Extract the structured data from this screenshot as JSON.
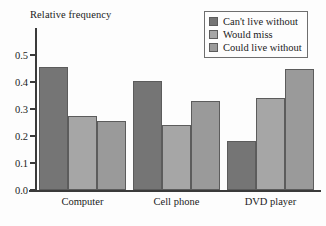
{
  "chart_data": {
    "type": "bar",
    "title": "",
    "xlabel": "",
    "ylabel": "Relative frequency",
    "ylim": [
      0.0,
      0.55
    ],
    "ytick_values": [
      0.0,
      0.1,
      0.2,
      0.3,
      0.4,
      0.5
    ],
    "ytick_labels": [
      "0.0",
      "0.1",
      "0.2",
      "0.3",
      "0.4",
      "0.5"
    ],
    "grid": false,
    "legend_position": "top-right",
    "categories": [
      "Computer",
      "Cell phone",
      "DVD player"
    ],
    "series": [
      {
        "name": "Can't live without",
        "color": "#757575",
        "values": [
          0.455,
          0.405,
          0.18
        ]
      },
      {
        "name": "Would miss",
        "color": "#a6a6a6",
        "values": [
          0.275,
          0.24,
          0.34
        ]
      },
      {
        "name": "Could live without",
        "color": "#9a9a9a",
        "values": [
          0.255,
          0.33,
          0.45
        ]
      }
    ]
  },
  "axes": {
    "y_title": "Relative frequency"
  },
  "legend": {
    "items": [
      {
        "label": "Can't live without"
      },
      {
        "label": "Would miss"
      },
      {
        "label": "Could live without"
      }
    ]
  }
}
